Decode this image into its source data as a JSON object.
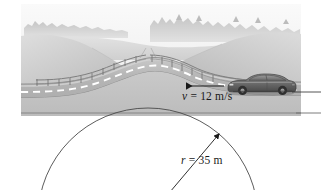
{
  "figure": {
    "name": "car-cresting-hill-circular-motion-diagram",
    "scene_elements": [
      "sky",
      "distant-treeline",
      "rolling-hills",
      "road",
      "dashed-center-line",
      "guardrail",
      "car",
      "velocity-arrow",
      "curvature-circle",
      "radius-arrow"
    ]
  },
  "labels": {
    "speed": {
      "symbol": "v",
      "equals": " = 12 m/s",
      "full": "v = 12 m/s",
      "value": 12,
      "unit": "m/s"
    },
    "radius": {
      "symbol": "r",
      "equals": " = 35 m",
      "full": "r = 35 m",
      "value": 35,
      "unit": "m"
    }
  },
  "colors": {
    "sky": "#f2f2f2",
    "far_hill": "#d8d8d8",
    "near_hill": "#c4c4c4",
    "hill_shadow": "#b0b0b0",
    "road_surface": "#b8b8b8",
    "road_light": "#cfcfcf",
    "road_marking": "#ffffff",
    "treeline": "#bdbdbd",
    "car_body": "#6e6e6e",
    "car_dark": "#3a3a3a",
    "line_black": "#1a1a1a",
    "arc_gray": "#555555",
    "background": "#ffffff"
  }
}
